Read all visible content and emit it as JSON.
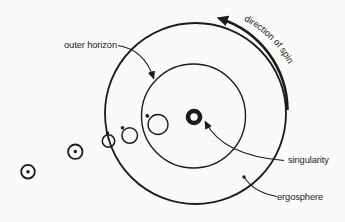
{
  "diagram": {
    "labels": {
      "outer_horizon": "outer horizon",
      "direction_of_spin": "direction of spin",
      "singularity": "singularity",
      "ergosphere": "ergosphere"
    },
    "colors": {
      "ink": "#1c1c1c",
      "background": "#fafaf8"
    },
    "structure": {
      "ergosphere_circle": {
        "cx": 195.5,
        "cy": 113.5,
        "r": 90.5,
        "stroke": 1.8
      },
      "outer_horizon_circle": {
        "cx": 193.5,
        "cy": 116,
        "r": 52,
        "stroke": 1.4
      },
      "singularity_ring": {
        "cx": 194,
        "cy": 117,
        "r": 6,
        "stroke": 4.6
      },
      "particles": [
        {
          "cx": 28,
          "cy": 171.7,
          "r": 6.8,
          "stroke": 1.8,
          "dot": {
            "x": 28,
            "y": 171.7,
            "r": 1.7
          }
        },
        {
          "cx": 75.3,
          "cy": 151.7,
          "r": 7.2,
          "stroke": 1.8,
          "dot": {
            "x": 75.3,
            "y": 151.5,
            "r": 1.7
          }
        },
        {
          "cx": 108.5,
          "cy": 141,
          "r": 6.2,
          "stroke": 1.5,
          "dot": {
            "x": 107.5,
            "y": 133,
            "r": 1.7
          }
        },
        {
          "cx": 129.7,
          "cy": 135.5,
          "r": 7.8,
          "stroke": 1.5,
          "dot": {
            "x": 122.5,
            "y": 127.8,
            "r": 1.8
          }
        },
        {
          "cx": 158,
          "cy": 124.5,
          "r": 10,
          "stroke": 1.3,
          "dot": {
            "x": 147.3,
            "y": 115.8,
            "r": 1.9
          }
        }
      ]
    }
  }
}
